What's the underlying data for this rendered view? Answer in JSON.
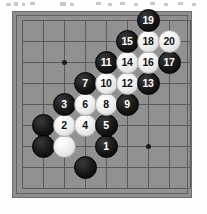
{
  "meta": {
    "kind": "go-board-diagram",
    "board_size_label": "",
    "board_color": "#919191",
    "line_color": "#5a5a5a",
    "black_color": "#0d0d0d",
    "white_color": "#ececec",
    "black_label_color": "#ffffff",
    "white_label_color": "#111111",
    "grid_columns": 9,
    "grid_rows": 9,
    "spacing_px": 21
  },
  "board": {
    "hoshi": [
      {
        "name": "hoshi-upper-left",
        "col": 2,
        "row": 2
      },
      {
        "name": "hoshi-upper-right",
        "col": 4,
        "row": 2
      },
      {
        "name": "hoshi-lower-left",
        "col": 2,
        "row": 4
      },
      {
        "name": "hoshi-lower-right",
        "col": 6,
        "row": 6
      }
    ],
    "stones": [
      {
        "label": "",
        "color": "black",
        "col": 1,
        "row": 5
      },
      {
        "label": "",
        "color": "black",
        "col": 1,
        "row": 6
      },
      {
        "label": "",
        "color": "white",
        "col": 2,
        "row": 6
      },
      {
        "label": "",
        "color": "black",
        "col": 3,
        "row": 7
      },
      {
        "label": "1",
        "color": "black",
        "col": 4,
        "row": 6
      },
      {
        "label": "2",
        "color": "white",
        "col": 2,
        "row": 5
      },
      {
        "label": "3",
        "color": "black",
        "col": 2,
        "row": 4
      },
      {
        "label": "4",
        "color": "white",
        "col": 3,
        "row": 5
      },
      {
        "label": "5",
        "color": "black",
        "col": 4,
        "row": 5
      },
      {
        "label": "6",
        "color": "white",
        "col": 3,
        "row": 4
      },
      {
        "label": "7",
        "color": "black",
        "col": 3,
        "row": 3
      },
      {
        "label": "8",
        "color": "white",
        "col": 4,
        "row": 4
      },
      {
        "label": "9",
        "color": "black",
        "col": 5,
        "row": 4
      },
      {
        "label": "10",
        "color": "white",
        "col": 4,
        "row": 3
      },
      {
        "label": "11",
        "color": "black",
        "col": 4,
        "row": 2
      },
      {
        "label": "12",
        "color": "white",
        "col": 5,
        "row": 3
      },
      {
        "label": "13",
        "color": "black",
        "col": 6,
        "row": 3
      },
      {
        "label": "14",
        "color": "white",
        "col": 5,
        "row": 2
      },
      {
        "label": "15",
        "color": "black",
        "col": 5,
        "row": 1
      },
      {
        "label": "16",
        "color": "white",
        "col": 6,
        "row": 2
      },
      {
        "label": "17",
        "color": "black",
        "col": 7,
        "row": 2
      },
      {
        "label": "18",
        "color": "white",
        "col": 6,
        "row": 1
      },
      {
        "label": "19",
        "color": "black",
        "col": 6,
        "row": 0
      },
      {
        "label": "20",
        "color": "white",
        "col": 7,
        "row": 1
      }
    ]
  }
}
